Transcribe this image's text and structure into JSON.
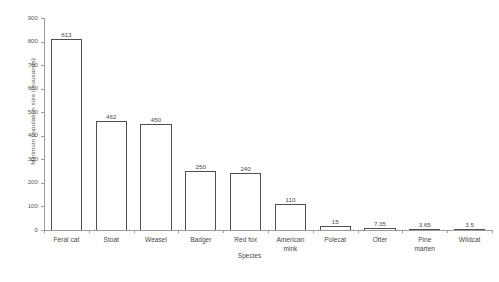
{
  "chart_data": {
    "type": "bar",
    "title": "",
    "xlabel": "Species",
    "ylabel": "Minimum population size (thousands)",
    "categories": [
      "Feral cat",
      "Stoat",
      "Weasel",
      "Badger",
      "Red fox",
      "American mink",
      "Polecat",
      "Otter",
      "Pine marten",
      "Wildcat"
    ],
    "values": [
      813,
      462,
      450,
      250,
      240,
      110,
      15,
      7.35,
      3.65,
      3.5
    ],
    "data_labels": [
      "813",
      "462",
      "450",
      "250",
      "240",
      "110",
      "15",
      "7.35",
      "3.65",
      "3.5"
    ],
    "ylim": [
      0,
      900
    ],
    "yticks": [
      0,
      100,
      200,
      300,
      400,
      500,
      600,
      700,
      800,
      900
    ],
    "ytick_labels": [
      "0",
      "100",
      "200",
      "300",
      "400",
      "500",
      "600",
      "700",
      "800",
      "900"
    ],
    "grid": false,
    "legend": null,
    "bar_style": {
      "fill": "#ffffff",
      "edge": "#4f4f4f"
    },
    "axis_color": "#9a9a9a",
    "text_color": "#4a4a4a"
  }
}
